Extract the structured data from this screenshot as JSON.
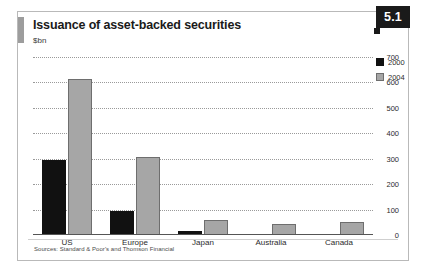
{
  "figure": {
    "badge": "5.1",
    "title": "Issuance of asset-backed securities",
    "subtitle": "$bn",
    "source": "Sources: Standard & Poor's and Thomson Financial"
  },
  "colors": {
    "series_2000": "#111111",
    "series_2004": "#a6a6a6",
    "badge_background": "#1a1a1a",
    "gridline": "#9a9a9a",
    "card_border": "#b9b9b9"
  },
  "chart_data": {
    "type": "bar",
    "title": "Issuance of asset-backed securities",
    "subtitle": "$bn",
    "xlabel": "",
    "ylabel": "$bn",
    "ylim": [
      0,
      700
    ],
    "yticks": [
      0,
      100,
      200,
      300,
      400,
      500,
      600,
      700
    ],
    "ytick_labels": [
      "0",
      "100",
      "200",
      "300",
      "400",
      "500",
      "600",
      "700"
    ],
    "grid": true,
    "y_axis_position": "right",
    "legend_position": "top-right",
    "categories": [
      "US",
      "Europe",
      "Japan",
      "Australia",
      "Canada"
    ],
    "series": [
      {
        "name": "2000",
        "color": "#111111",
        "values": [
          295,
          95,
          15,
          3,
          3
        ]
      },
      {
        "name": "2004",
        "color": "#a6a6a6",
        "values": [
          615,
          305,
          58,
          45,
          50
        ]
      }
    ]
  }
}
